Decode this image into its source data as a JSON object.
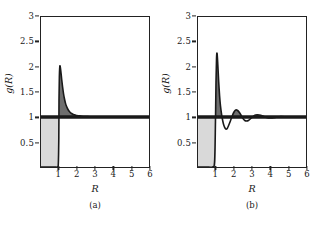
{
  "figure": {
    "background_color": "#ffffff",
    "axis_color": "#222222",
    "curve_color": "#1a1a1a",
    "excluded_fill_color": "#d9d9d9",
    "peak_fill_color": "#6e6e6e"
  },
  "chart_data": [
    {
      "type": "line",
      "panel": "a",
      "caption": "(a)",
      "title": "",
      "xlabel": "R",
      "ylabel": "g(R)",
      "xlim": [
        0,
        6
      ],
      "ylim": [
        0,
        3
      ],
      "xticks": [
        1,
        2,
        3,
        4,
        5,
        6
      ],
      "xticklabels": [
        "1",
        "2",
        "3",
        "4",
        "5",
        "6"
      ],
      "yticks": [
        0.5,
        1,
        1.5,
        2,
        2.5,
        3
      ],
      "yticklabels": [
        "0.5",
        "1",
        "1.5",
        "2",
        "2.5",
        "3"
      ],
      "grid": false,
      "legend": null,
      "reference_line_y": 1,
      "shaded_core_region": {
        "x_from": 0,
        "x_to": 1,
        "y_from": 0,
        "y_to": 1
      },
      "x": [
        0.0,
        0.2,
        0.4,
        0.6,
        0.8,
        0.9,
        0.96,
        0.99,
        1.0,
        1.02,
        1.05,
        1.1,
        1.15,
        1.2,
        1.25,
        1.3,
        1.35,
        1.4,
        1.5,
        1.6,
        1.7,
        1.8,
        1.9,
        2.0,
        2.2,
        2.4,
        2.6,
        2.8,
        3.0,
        3.5,
        4.0,
        4.5,
        5.0,
        5.5,
        6.0
      ],
      "values": [
        0.0,
        0.0,
        0.0,
        0.0,
        0.0,
        0.0,
        0.05,
        0.6,
        1.35,
        1.8,
        2.02,
        1.92,
        1.75,
        1.6,
        1.47,
        1.37,
        1.29,
        1.23,
        1.15,
        1.1,
        1.07,
        1.05,
        1.04,
        1.03,
        1.02,
        1.01,
        1.01,
        1.0,
        1.0,
        1.0,
        1.0,
        1.0,
        1.0,
        1.0,
        1.0
      ],
      "peak": {
        "x": 1.05,
        "y": 2.02
      },
      "notes": "Radial distribution function with a single sharp first-neighbour peak decaying monotonically to unity."
    },
    {
      "type": "line",
      "panel": "b",
      "caption": "(b)",
      "title": "",
      "xlabel": "R",
      "ylabel": "g(R)",
      "xlim": [
        0,
        6
      ],
      "ylim": [
        0,
        3
      ],
      "xticks": [
        1,
        2,
        3,
        4,
        5,
        6
      ],
      "xticklabels": [
        "1",
        "2",
        "3",
        "4",
        "5",
        "6"
      ],
      "yticks": [
        0.5,
        1,
        1.5,
        2,
        2.5,
        3
      ],
      "yticklabels": [
        "0.5",
        "1",
        "1.5",
        "2",
        "2.5",
        "3"
      ],
      "grid": false,
      "legend": null,
      "reference_line_y": 1,
      "shaded_core_region": {
        "x_from": 0,
        "x_to": 1,
        "y_from": 0,
        "y_to": 1
      },
      "x": [
        0.0,
        0.3,
        0.6,
        0.8,
        0.92,
        0.97,
        1.0,
        1.03,
        1.06,
        1.1,
        1.15,
        1.2,
        1.25,
        1.3,
        1.35,
        1.4,
        1.45,
        1.5,
        1.55,
        1.6,
        1.65,
        1.7,
        1.8,
        1.9,
        2.0,
        2.1,
        2.2,
        2.3,
        2.4,
        2.5,
        2.6,
        2.7,
        2.8,
        2.9,
        3.0,
        3.1,
        3.2,
        3.4,
        3.6,
        3.8,
        4.0,
        4.3,
        4.6,
        5.0,
        5.5,
        6.0
      ],
      "values": [
        0.0,
        0.0,
        0.0,
        0.0,
        0.1,
        0.9,
        1.7,
        2.18,
        2.27,
        2.05,
        1.7,
        1.42,
        1.22,
        1.08,
        0.97,
        0.88,
        0.82,
        0.78,
        0.76,
        0.76,
        0.79,
        0.83,
        0.92,
        1.02,
        1.1,
        1.14,
        1.13,
        1.09,
        1.03,
        0.97,
        0.93,
        0.92,
        0.93,
        0.96,
        0.99,
        1.02,
        1.04,
        1.04,
        1.02,
        0.99,
        0.98,
        0.99,
        1.01,
        1.0,
        1.0,
        1.0
      ],
      "peak": {
        "x": 1.06,
        "y": 2.27
      },
      "notes": "Radial distribution function with a tall first peak followed by damped oscillations converging to unity."
    }
  ]
}
